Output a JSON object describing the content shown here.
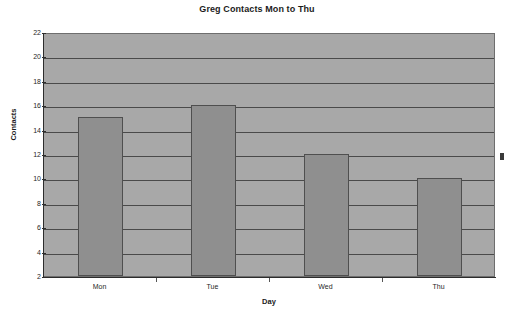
{
  "chart_data": {
    "type": "bar",
    "title": "Greg Contacts Mon to Thu",
    "xlabel": "Day",
    "ylabel": "Contacts",
    "categories": [
      "Mon",
      "Tue",
      "Wed",
      "Thu"
    ],
    "values": [
      15,
      16,
      12,
      10
    ],
    "ylim": [
      2,
      22
    ],
    "ytick_step": 2,
    "yticks": [
      2,
      4,
      6,
      8,
      10,
      12,
      14,
      16,
      18,
      20,
      22
    ],
    "ytick_labels": [
      "2",
      "4",
      "6",
      "8",
      "10",
      "12",
      "14",
      "16",
      "18",
      "20",
      "22"
    ],
    "grid": true,
    "grid_axis": "y",
    "legend": false,
    "legend_position": "none",
    "series": [
      {
        "name": "Contacts",
        "values": [
          15,
          16,
          12,
          10
        ]
      }
    ],
    "colors": {
      "plot_background": "#a8a8a8",
      "bar_fill": "#8f8f8f",
      "bar_border": "#4f4f4f",
      "gridline": "#4a4a4a",
      "axis": "#2c2c2c",
      "text": "#1b1b1b",
      "page_background": "#ffffff"
    }
  },
  "artifact": {
    "label": "edge-mark"
  }
}
